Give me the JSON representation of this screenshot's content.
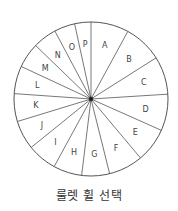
{
  "diagram": {
    "center": [
      91,
      99
    ],
    "radius": 77,
    "stroke_color": "#555555",
    "hub_color": "#222222",
    "segments": [
      {
        "label": "A",
        "start": 0,
        "end": 28.6
      },
      {
        "label": "B",
        "start": 28.6,
        "end": 57.7
      },
      {
        "label": "C",
        "start": 57.7,
        "end": 86.4
      },
      {
        "label": "D",
        "start": 86.4,
        "end": 114
      },
      {
        "label": "E",
        "start": 114,
        "end": 140
      },
      {
        "label": "F",
        "start": 140,
        "end": 166
      },
      {
        "label": "G",
        "start": 166,
        "end": 187
      },
      {
        "label": "H",
        "start": 187,
        "end": 208.6
      },
      {
        "label": "I",
        "start": 208.6,
        "end": 231
      },
      {
        "label": "J",
        "start": 231,
        "end": 253
      },
      {
        "label": "K",
        "start": 253,
        "end": 274
      },
      {
        "label": "L",
        "start": 274,
        "end": 295
      },
      {
        "label": "M",
        "start": 295,
        "end": 314
      },
      {
        "label": "N",
        "start": 314,
        "end": 332
      },
      {
        "label": "O",
        "start": 332,
        "end": 347.7
      },
      {
        "label": "P",
        "start": 347.7,
        "end": 360
      }
    ]
  },
  "caption": "룰렛 휠 선택"
}
